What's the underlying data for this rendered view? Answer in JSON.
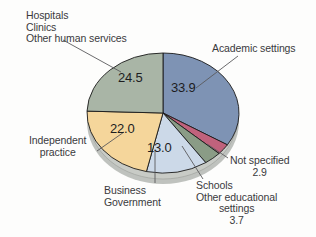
{
  "chart_data": {
    "type": "pie",
    "title": "",
    "subtitle": "",
    "xlabel": "",
    "ylabel": "",
    "legend_position": "callout-labels",
    "grid": false,
    "units": "percent",
    "categories": [
      "Academic settings",
      "Not specified",
      "Schools Other educational settings",
      "Business Government",
      "Independent practice",
      "Hospitals Clinics Other human services"
    ],
    "values": [
      33.9,
      2.9,
      3.7,
      13.0,
      22.0,
      24.5
    ],
    "colors": [
      "#7e93b4",
      "#c0627c",
      "#8a9c86",
      "#ccd9e8",
      "#f5d69b",
      "#a9b5a6"
    ],
    "slices": [
      {
        "name": "academic-settings",
        "label": "Academic settings",
        "value": 33.9,
        "value_text": "33.9",
        "color": "#7e93b4",
        "label_lines": [
          "Academic settings"
        ]
      },
      {
        "name": "not-specified",
        "label": "Not specified",
        "value": 2.9,
        "value_text": "2.9",
        "color": "#c0627c",
        "label_lines": [
          "Not specified"
        ]
      },
      {
        "name": "schools-other-educational-settings",
        "label": "Schools Other educational settings",
        "value": 3.7,
        "value_text": "3.7",
        "color": "#8a9c86",
        "label_lines": [
          "Schools",
          "Other educational",
          "settings"
        ]
      },
      {
        "name": "business-government",
        "label": "Business Government",
        "value": 13.0,
        "value_text": "13.0",
        "color": "#ccd9e8",
        "label_lines": [
          "Business",
          "Government"
        ]
      },
      {
        "name": "independent-practice",
        "label": "Independent practice",
        "value": 22.0,
        "value_text": "22.0",
        "color": "#f5d69b",
        "label_lines": [
          "Independent",
          "practice"
        ]
      },
      {
        "name": "hospitals-clinics-other-human-services",
        "label": "Hospitals Clinics Other human services",
        "value": 24.5,
        "value_text": "24.5",
        "color": "#a9b5a6",
        "label_lines": [
          "Hospitals",
          "Clinics",
          "Other human services"
        ]
      }
    ]
  },
  "labels": {
    "hospitals_line1": "Hospitals",
    "hospitals_line2": "Clinics",
    "hospitals_line3": "Other human services",
    "academic": "Academic settings",
    "independent_line1": "Independent",
    "independent_line2": "practice",
    "business_line1": "Business",
    "business_line2": "Government",
    "not_specified": "Not specified",
    "not_specified_value": "2.9",
    "schools_line1": "Schools",
    "schools_line2": "Other educational",
    "schools_line3": "settings",
    "schools_value": "3.7"
  },
  "values": {
    "academic": "33.9",
    "hospitals": "24.5",
    "independent": "22.0",
    "business": "13.0"
  },
  "colors": {
    "background": "#fdfdfc",
    "text": "#3a3a3c",
    "value_text": "#1d1d1f",
    "outline": "#1a1a1a",
    "shadow": "#b9bcb8",
    "leader": "#5a5a5c"
  }
}
